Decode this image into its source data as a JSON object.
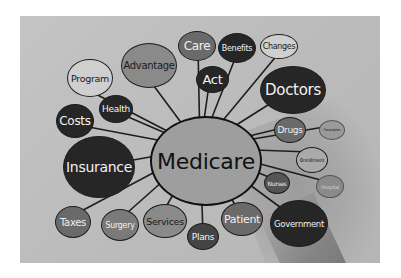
{
  "image": {
    "description": "Grayscale photo of a hand drawing a mind map around the word Medicare",
    "center_node": "Medicare",
    "nodes": [
      {
        "label": "Care"
      },
      {
        "label": "Benefits"
      },
      {
        "label": "Changes"
      },
      {
        "label": "Advantage"
      },
      {
        "label": "Program"
      },
      {
        "label": "Act"
      },
      {
        "label": "Doctors"
      },
      {
        "label": "Health"
      },
      {
        "label": "Costs"
      },
      {
        "label": "Insurance"
      },
      {
        "label": "Drugs"
      },
      {
        "label": "Prescription"
      },
      {
        "label": "Enrollment"
      },
      {
        "label": "Nurses"
      },
      {
        "label": "Hospital"
      },
      {
        "label": "Taxes"
      },
      {
        "label": "Surgery"
      },
      {
        "label": "Services"
      },
      {
        "label": "Plans"
      },
      {
        "label": "Patient"
      },
      {
        "label": "Government"
      }
    ]
  }
}
